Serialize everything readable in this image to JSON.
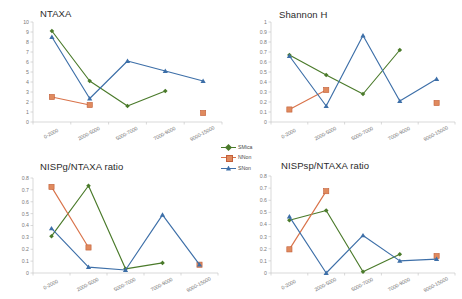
{
  "figure": {
    "background": "#ffffff",
    "categories": [
      "0-2000",
      "2000-5000",
      "5000-7000",
      "7000-9000",
      "9000-15000"
    ],
    "series_colors": {
      "SMica": "#4a7a2a",
      "NNon": "#d9734a",
      "SNon": "#3d6fa8"
    }
  },
  "legend": {
    "position": "center-middle",
    "items": [
      {
        "label": "SMica",
        "color": "#4a7a2a",
        "marker": "diamond"
      },
      {
        "label": "NNon",
        "color": "#d9734a",
        "marker": "square"
      },
      {
        "label": "SNon",
        "color": "#3d6fa8",
        "marker": "triangle"
      }
    ]
  },
  "chart_data": [
    {
      "id": "ntaxa",
      "type": "line",
      "title": "NTAXA",
      "xlabel": "",
      "ylabel": "",
      "ylim": [
        0,
        10
      ],
      "yticks": [
        0,
        1,
        2,
        3,
        4,
        5,
        6,
        7,
        8,
        9,
        10
      ],
      "ytick_labels": [
        "0",
        "1",
        "2",
        "3",
        "4",
        "5",
        "6",
        "7",
        "8",
        "9",
        "10"
      ],
      "grid": false,
      "categories": [
        "0-2000",
        "2000-5000",
        "5000-7000",
        "7000-9000",
        "9000-15000"
      ],
      "series": [
        {
          "name": "SMica",
          "color": "#4a7a2a",
          "marker": "diamond",
          "values": [
            9.1,
            4.1,
            1.6,
            3.1,
            null
          ]
        },
        {
          "name": "NNon",
          "color": "#d9734a",
          "marker": "square",
          "values": [
            2.5,
            1.7,
            null,
            null,
            0.9
          ]
        },
        {
          "name": "SNon",
          "color": "#3d6fa8",
          "marker": "triangle",
          "values": [
            8.5,
            2.35,
            6.1,
            5.1,
            4.1
          ]
        }
      ]
    },
    {
      "id": "shannon-h",
      "type": "line",
      "title": "Shannon H",
      "xlabel": "",
      "ylabel": "",
      "ylim": [
        0,
        1
      ],
      "yticks": [
        0,
        0.1,
        0.2,
        0.3,
        0.4,
        0.5,
        0.6,
        0.7,
        0.8,
        0.9,
        1
      ],
      "ytick_labels": [
        "0",
        "0.1",
        "0.2",
        "0.3",
        "0.4",
        "0.5",
        "0.6",
        "0.7",
        "0.8",
        "0.9",
        "1"
      ],
      "grid": false,
      "categories": [
        "0-2000",
        "2000-5000",
        "5000-7000",
        "7000-9000",
        "9000-15000"
      ],
      "series": [
        {
          "name": "SMica",
          "color": "#4a7a2a",
          "marker": "diamond",
          "values": [
            0.67,
            0.47,
            0.28,
            0.72,
            null
          ]
        },
        {
          "name": "NNon",
          "color": "#d9734a",
          "marker": "square",
          "values": [
            0.125,
            0.32,
            null,
            null,
            0.19
          ]
        },
        {
          "name": "SNon",
          "color": "#3d6fa8",
          "marker": "triangle",
          "values": [
            0.66,
            0.16,
            0.865,
            0.21,
            0.43
          ]
        }
      ]
    },
    {
      "id": "nispg-ntaxa-ratio",
      "type": "line",
      "title": "NISPg/NTAXA ratio",
      "xlabel": "",
      "ylabel": "",
      "ylim": [
        0,
        0.8
      ],
      "yticks": [
        0,
        0.1,
        0.2,
        0.3,
        0.4,
        0.5,
        0.6,
        0.7,
        0.8
      ],
      "ytick_labels": [
        "0",
        "0.1",
        "0.2",
        "0.3",
        "0.4",
        "0.5",
        "0.6",
        "0.7",
        "0.8"
      ],
      "grid": false,
      "categories": [
        "0-2000",
        "2000-5000",
        "5000-7000",
        "7000-9000",
        "9000-15000"
      ],
      "series": [
        {
          "name": "SMica",
          "color": "#4a7a2a",
          "marker": "diamond",
          "values": [
            0.31,
            0.735,
            0.035,
            0.085,
            null
          ]
        },
        {
          "name": "NNon",
          "color": "#d9734a",
          "marker": "square",
          "values": [
            0.725,
            0.215,
            null,
            null,
            0.07
          ]
        },
        {
          "name": "SNon",
          "color": "#3d6fa8",
          "marker": "triangle",
          "values": [
            0.375,
            0.05,
            0.025,
            0.49,
            0.07
          ]
        }
      ]
    },
    {
      "id": "nispsp-ntaxa-ratio",
      "type": "line",
      "title": "NISPsp/NTAXA ratio",
      "xlabel": "",
      "ylabel": "",
      "ylim": [
        0,
        0.8
      ],
      "yticks": [
        0,
        0.1,
        0.2,
        0.3,
        0.4,
        0.5,
        0.6,
        0.7,
        0.8
      ],
      "ytick_labels": [
        "0",
        "0.1",
        "0.2",
        "0.3",
        "0.4",
        "0.5",
        "0.6",
        "0.7",
        "0.8"
      ],
      "grid": false,
      "categories": [
        "0-2000",
        "2000-5000",
        "5000-7000",
        "7000-9000",
        "9000-15000"
      ],
      "series": [
        {
          "name": "SMica",
          "color": "#4a7a2a",
          "marker": "diamond",
          "values": [
            0.435,
            0.515,
            0.01,
            0.155,
            null
          ]
        },
        {
          "name": "NNon",
          "color": "#d9734a",
          "marker": "square",
          "values": [
            0.195,
            0.675,
            null,
            null,
            0.14
          ]
        },
        {
          "name": "SNon",
          "color": "#3d6fa8",
          "marker": "triangle",
          "values": [
            0.465,
            0.0,
            0.31,
            0.1,
            0.115
          ]
        }
      ]
    }
  ]
}
